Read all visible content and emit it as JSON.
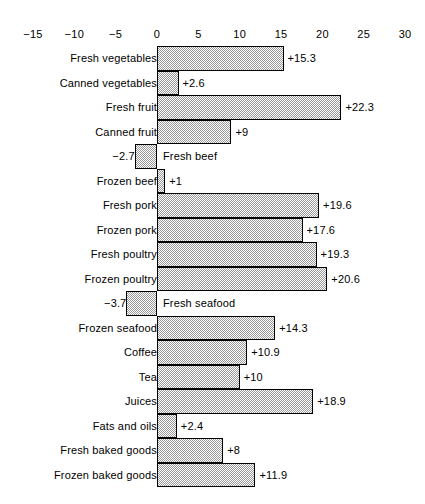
{
  "chart_data": {
    "type": "bar",
    "orientation": "horizontal",
    "title": "",
    "subtitle": "",
    "xlabel": "",
    "ylabel": "",
    "xlim": [
      -15,
      30
    ],
    "xticks": [
      -15,
      -10,
      -5,
      0,
      5,
      10,
      15,
      20,
      25,
      30
    ],
    "xtick_labels": [
      "−15",
      "−10",
      "−5",
      "0",
      "5",
      "10",
      "15",
      "20",
      "25",
      "30"
    ],
    "grid": false,
    "legend": null,
    "bar_fill": "#9a9a9a",
    "bar_edge": "#000000",
    "categories": [
      "Fresh vegetables",
      "Canned vegetables",
      "Fresh fruit",
      "Canned fruit",
      "Fresh beef",
      "Frozen beef",
      "Fresh pork",
      "Frozen pork",
      "Fresh poultry",
      "Frozen poultry",
      "Fresh seafood",
      "Frozen seafood",
      "Coffee",
      "Tea",
      "Juices",
      "Fats and oils",
      "Fresh baked goods",
      "Frozen baked goods"
    ],
    "values": [
      15.3,
      2.6,
      22.3,
      9,
      -2.7,
      1,
      19.6,
      17.6,
      19.3,
      20.6,
      -3.7,
      14.3,
      10.9,
      10,
      18.9,
      2.4,
      8,
      11.9
    ],
    "data_labels": [
      "+15.3",
      "+2.6",
      "+22.3",
      "+9",
      "−2.7",
      "+1",
      "+19.6",
      "+17.6",
      "+19.3",
      "+20.6",
      "−3.7",
      "+14.3",
      "+10.9",
      "+10",
      "+18.9",
      "+2.4",
      "+8",
      "+11.9"
    ]
  }
}
